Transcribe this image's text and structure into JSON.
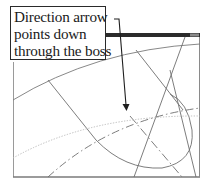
{
  "callout": {
    "lines": [
      "Direction arrow",
      "points down",
      "through the boss"
    ]
  },
  "colors": {
    "frame": "#7a7a7a",
    "title_bar": "#2b2b2b",
    "geometry": "#6e6e6e",
    "dotted": "#bdbdbd",
    "arrow": "#1e1e1e",
    "text": "#1a1a1a"
  },
  "icons": {
    "direction_arrow": "arrow-down"
  }
}
